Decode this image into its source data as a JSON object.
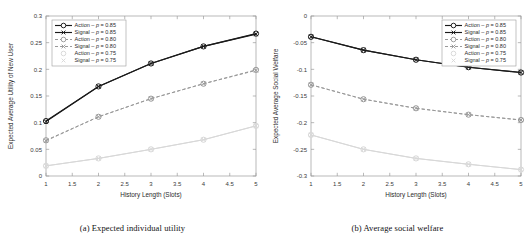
{
  "figure": {
    "panels": [
      {
        "caption": "(a)  Expected individual utility",
        "chart_data": {
          "type": "line",
          "title": "",
          "xlabel": "History Length (Slots)",
          "ylabel": "Expected Average Utility of New User",
          "x": [
            1,
            2,
            3,
            4,
            5
          ],
          "xlim": [
            1,
            5
          ],
          "ylim": [
            0,
            0.3
          ],
          "xticks": [
            "1",
            "1.5",
            "2",
            "2.5",
            "3",
            "3.5",
            "4",
            "4.5",
            "5"
          ],
          "xtickvalues": [
            1,
            1.5,
            2,
            2.5,
            3,
            3.5,
            4,
            4.5,
            5
          ],
          "yticks": [
            "0",
            "0.05",
            "0.1",
            "0.15",
            "0.2",
            "0.25",
            "0.3"
          ],
          "ytickvalues": [
            0,
            0.05,
            0.1,
            0.15,
            0.2,
            0.25,
            0.3
          ],
          "grid": false,
          "legend_position": "upper-left",
          "series": [
            {
              "name": "Action – p = 0.85",
              "marker": "circle",
              "line": "solid",
              "color": "#1a1a1a",
              "values": [
                0.103,
                0.168,
                0.211,
                0.243,
                0.267
              ]
            },
            {
              "name": "Signal – p = 0.85",
              "marker": "x",
              "line": "solid",
              "color": "#1a1a1a",
              "values": [
                0.102,
                0.168,
                0.211,
                0.243,
                0.266
              ]
            },
            {
              "name": "Action – p = 0.80",
              "marker": "circle",
              "line": "dashed",
              "color": "#9a9a9a",
              "values": [
                0.067,
                0.111,
                0.145,
                0.173,
                0.199
              ]
            },
            {
              "name": "Signal – p = 0.80",
              "marker": "x",
              "line": "dashed",
              "color": "#9a9a9a",
              "values": [
                0.066,
                0.111,
                0.145,
                0.173,
                0.198
              ]
            },
            {
              "name": "Action – p = 0.75",
              "marker": "circle",
              "line": "solid",
              "color": "#d8d8d8",
              "values": [
                0.019,
                0.033,
                0.05,
                0.068,
                0.094
              ]
            },
            {
              "name": "Signal – p = 0.75",
              "marker": "x",
              "line": "solid",
              "color": "#d8d8d8",
              "values": [
                0.019,
                0.033,
                0.05,
                0.068,
                0.094
              ]
            }
          ]
        }
      },
      {
        "caption": "(b)  Average social welfare",
        "chart_data": {
          "type": "line",
          "title": "",
          "xlabel": "History Length (Slots)",
          "ylabel": "Expected Average Social Welfare",
          "x": [
            1,
            2,
            3,
            4,
            5
          ],
          "xlim": [
            1,
            5
          ],
          "ylim": [
            -0.3,
            0
          ],
          "xticks": [
            "1",
            "1.5",
            "2",
            "2.5",
            "3",
            "3.5",
            "4",
            "4.5",
            "5"
          ],
          "xtickvalues": [
            1,
            1.5,
            2,
            2.5,
            3,
            3.5,
            4,
            4.5,
            5
          ],
          "yticks": [
            "-0.3",
            "-0.25",
            "-0.2",
            "-0.15",
            "-0.1",
            "-0.05",
            "0"
          ],
          "ytickvalues": [
            -0.3,
            -0.25,
            -0.2,
            -0.15,
            -0.1,
            -0.05,
            0
          ],
          "grid": false,
          "legend_position": "upper-right",
          "series": [
            {
              "name": "Action – p = 0.85",
              "marker": "circle",
              "line": "solid",
              "color": "#1a1a1a",
              "values": [
                -0.039,
                -0.064,
                -0.082,
                -0.096,
                -0.106
              ]
            },
            {
              "name": "Signal – p = 0.85",
              "marker": "x",
              "line": "solid",
              "color": "#1a1a1a",
              "values": [
                -0.039,
                -0.064,
                -0.082,
                -0.096,
                -0.106
              ]
            },
            {
              "name": "Action – p = 0.80",
              "marker": "circle",
              "line": "dashed",
              "color": "#9a9a9a",
              "values": [
                -0.129,
                -0.156,
                -0.173,
                -0.185,
                -0.195
              ]
            },
            {
              "name": "Signal – p = 0.80",
              "marker": "x",
              "line": "dashed",
              "color": "#9a9a9a",
              "values": [
                -0.129,
                -0.156,
                -0.173,
                -0.185,
                -0.195
              ]
            },
            {
              "name": "Action – p = 0.75",
              "marker": "circle",
              "line": "solid",
              "color": "#d8d8d8",
              "values": [
                -0.223,
                -0.25,
                -0.267,
                -0.278,
                -0.288
              ]
            },
            {
              "name": "Signal – p = 0.75",
              "marker": "x",
              "line": "solid",
              "color": "#d8d8d8",
              "values": [
                -0.223,
                -0.25,
                -0.267,
                -0.278,
                -0.288
              ]
            }
          ]
        }
      }
    ]
  }
}
